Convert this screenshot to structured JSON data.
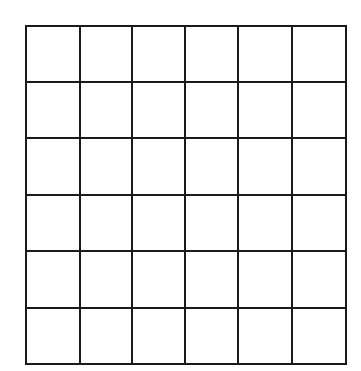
{
  "grid": {
    "rows": 6,
    "cols": 6,
    "col_edges": [
      26,
      80,
      132,
      185,
      238,
      292,
      346
    ],
    "row_edges": [
      26,
      82,
      138,
      195,
      251,
      308,
      364
    ],
    "line_color": "#1a1a1a",
    "line_width": 2,
    "background": "#ffffff"
  }
}
